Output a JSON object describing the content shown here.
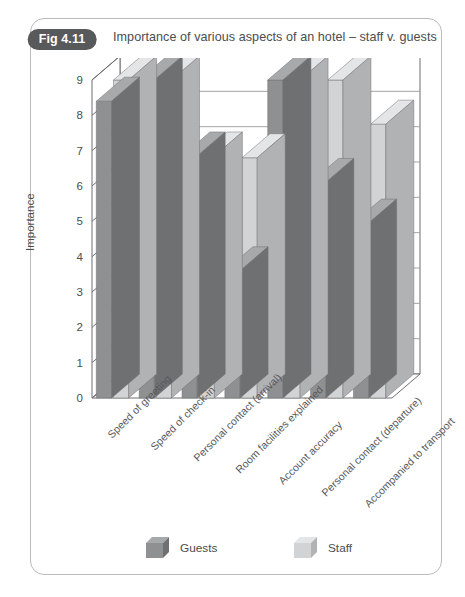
{
  "figure": {
    "badge": "Fig 4.11",
    "title": "Importance of various aspects of an hotel – staff v. guests"
  },
  "colors": {
    "guests_front": "#8f9092",
    "guests_top": "#a8a9ab",
    "guests_side": "#6f7072",
    "staff_front": "#d2d3d4",
    "staff_top": "#e4e5e6",
    "staff_side": "#b1b2b4",
    "badge": "#58595b",
    "frame": "#b9bbbd",
    "axis": "#6d6e70",
    "grid": "#9a9b9d",
    "text": "#4b4d4f"
  },
  "chart_data": {
    "type": "bar",
    "title": "Importance of various aspects of an hotel – staff v. guests",
    "xlabel": "",
    "ylabel": "Importance",
    "ylim": [
      0,
      9
    ],
    "yticks": [
      0,
      1,
      2,
      3,
      4,
      5,
      6,
      7,
      8,
      9
    ],
    "grid": true,
    "legend_position": "bottom",
    "three_d": true,
    "categories": [
      "Speed of greeting",
      "Speed of check-in",
      "Personal contact (arrival)",
      "Room facilities explained",
      "Account accuracy",
      "Personal contact (departure)",
      "Accompanied to transport"
    ],
    "series": [
      {
        "name": "Guests",
        "values": [
          8.4,
          9.0,
          6.85,
          3.6,
          9.0,
          6.1,
          4.95
        ]
      },
      {
        "name": "Staff",
        "values": [
          9.0,
          9.0,
          6.85,
          6.8,
          9.0,
          9.0,
          7.75
        ]
      }
    ]
  },
  "legend": {
    "guests": "Guests",
    "staff": "Staff"
  }
}
